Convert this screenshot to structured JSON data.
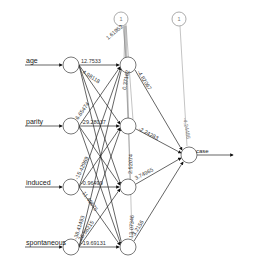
{
  "diagram": {
    "type": "neural-network",
    "inputs": [
      {
        "label": "age"
      },
      {
        "label": "parity"
      },
      {
        "label": "induced"
      },
      {
        "label": "spontaneous"
      }
    ],
    "hidden_count": 4,
    "output": {
      "label": "case"
    },
    "bias_label": "1",
    "weights": {
      "input_to_hidden_visible": {
        "age_h1": "12.7533",
        "age_h2": "4.98118",
        "parity_h1": "6.65474",
        "parity_h2": "-29.28037",
        "induced_h1": "-15.42969",
        "induced_h3": "-0.96499",
        "induced_h4": "11.49675",
        "spontaneous_h1": "-38.41493",
        "spontaneous_h2": "26.56215",
        "spontaneous_h4": "-19.69131"
      },
      "bias_to_hidden_h1": "1.61952",
      "bias_hidden_other": "0.37162",
      "hidden_to_output": [
        "-4.82067",
        "-2.24283",
        "3.74965",
        "3.2156"
      ],
      "hidden_vertical_labels": [
        "2.52074",
        "13.07346"
      ],
      "bias_to_output": "-4.24486"
    }
  }
}
